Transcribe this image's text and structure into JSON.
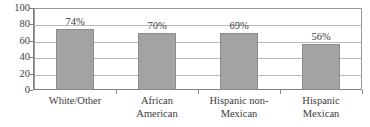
{
  "chart_data": {
    "type": "bar",
    "title": "",
    "xlabel": "",
    "ylabel": "",
    "ylim": [
      0,
      100
    ],
    "yticks": [
      0,
      20,
      40,
      60,
      80,
      100
    ],
    "grid": true,
    "legend": false,
    "categories": [
      "White/Other",
      "African American",
      "Hispanic non-Mexican",
      "Hispanic Mexican"
    ],
    "category_lines": [
      [
        "White/Other"
      ],
      [
        "African",
        "American"
      ],
      [
        "Hispanic non-",
        "Mexican"
      ],
      [
        "Hispanic",
        "Mexican"
      ]
    ],
    "values": [
      74,
      70,
      69,
      56
    ],
    "data_labels": [
      "74%",
      "70%",
      "69%",
      "56%"
    ],
    "bar_color": "#a3a3a3",
    "bar_border_color": "#8d8d8d",
    "grid_color": "#b9b9b9",
    "axis_color": "#7d7d7d",
    "text_color": "#3c3c3c"
  }
}
